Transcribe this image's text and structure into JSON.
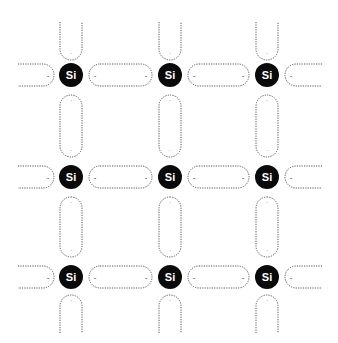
{
  "diagram": {
    "atom_label": "Si",
    "electron_glyph": "-",
    "colors": {
      "atom_fill": "#0a0a0a",
      "atom_text": "#ffffff",
      "bond_stroke": "#555555",
      "background": "#ffffff"
    },
    "columns_x": [
      71,
      170,
      267
    ],
    "rows_y": [
      75,
      177,
      277
    ],
    "atom_radius": 12,
    "atoms": [
      {
        "label": "Si",
        "row": 0,
        "col": 0
      },
      {
        "label": "Si",
        "row": 0,
        "col": 1
      },
      {
        "label": "Si",
        "row": 0,
        "col": 2
      },
      {
        "label": "Si",
        "row": 1,
        "col": 0
      },
      {
        "label": "Si",
        "row": 1,
        "col": 1
      },
      {
        "label": "Si",
        "row": 1,
        "col": 2
      },
      {
        "label": "Si",
        "row": 2,
        "col": 0
      },
      {
        "label": "Si",
        "row": 2,
        "col": 1
      },
      {
        "label": "Si",
        "row": 2,
        "col": 2
      }
    ]
  }
}
